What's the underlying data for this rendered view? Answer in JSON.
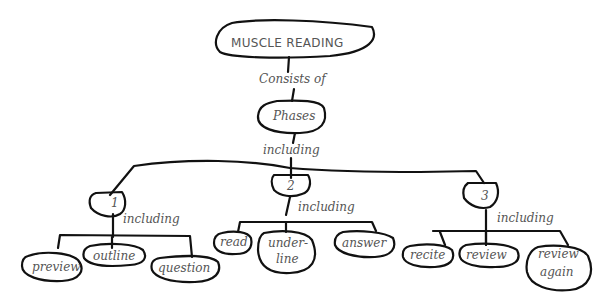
{
  "diagram": {
    "type": "concept-map",
    "root": {
      "label": "MUSCLE READING"
    },
    "link_root": "Consists of",
    "phases_node": {
      "label": "Phases"
    },
    "link_phases": "including",
    "phases": [
      {
        "label": "1",
        "link": "including",
        "children": [
          "preview",
          "outline",
          "question"
        ]
      },
      {
        "label": "2",
        "link": "including",
        "children": [
          "read",
          "under-",
          "line",
          "answer"
        ]
      },
      {
        "label": "3",
        "link": "including",
        "children": [
          "recite",
          "review",
          "review",
          "again"
        ]
      }
    ],
    "colors": {
      "ink": "#111111",
      "text": "#555555",
      "background": "#ffffff"
    }
  }
}
